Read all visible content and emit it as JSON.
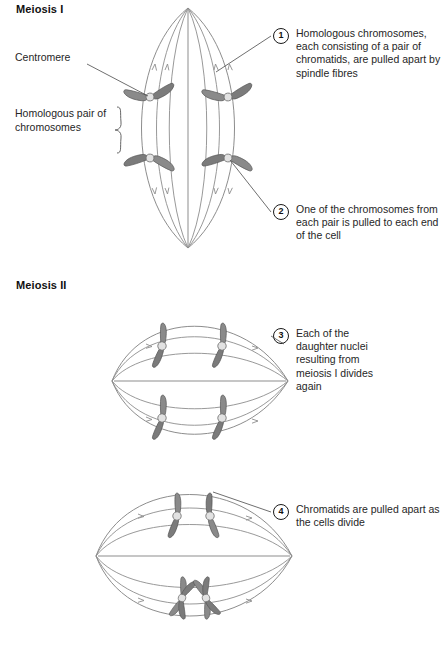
{
  "figure": {
    "title": "Meiosis",
    "sections": [
      {
        "id": "meiosis-1",
        "heading": "Meiosis I"
      },
      {
        "id": "meiosis-2",
        "heading": "Meiosis II"
      }
    ]
  },
  "labels": {
    "centromere": "Centromere",
    "homologous_pair": "Homologous pair of chromosomes"
  },
  "callouts": [
    {
      "number": "1",
      "text": "Homologous chromosomes, each consisting of a pair of chromatids, are pulled apart by spindle fibres"
    },
    {
      "number": "2",
      "text": "One of the chromosomes from each pair is pulled to each end of the cell"
    },
    {
      "number": "3",
      "text": "Each of the daughter nuclei resulting from meiosis I divides again"
    },
    {
      "number": "4",
      "text": "Chromatids are pulled apart as the cells divide"
    }
  ],
  "colors": {
    "chromosome_arm": "#8a8a8a",
    "chromosome_arm_dark": "#7b7b7b",
    "chromosome_outline": "#5a5a5a",
    "centromere_fill": "#e2e2e2",
    "spindle_fibre": "#8d8d8d",
    "leader_line": "#4a4a4a",
    "text": "#262626",
    "heading": "#111111",
    "background": "#ffffff"
  },
  "diagram": {
    "cells": [
      {
        "name": "meiosis-i-cell",
        "stage": "Anaphase I",
        "orientation": "vertical-lens",
        "chromosome_count": 4,
        "division_axis": "vertical"
      },
      {
        "name": "meiosis-ii-cell-upper",
        "stage": "Metaphase II / Anaphase II",
        "orientation": "horizontal-lens",
        "chromosome_count": 4,
        "division_axis": "horizontal"
      },
      {
        "name": "meiosis-ii-cell-lower",
        "stage": "Anaphase II",
        "orientation": "horizontal-lens",
        "chromosome_count": 4,
        "division_axis": "horizontal"
      }
    ]
  }
}
